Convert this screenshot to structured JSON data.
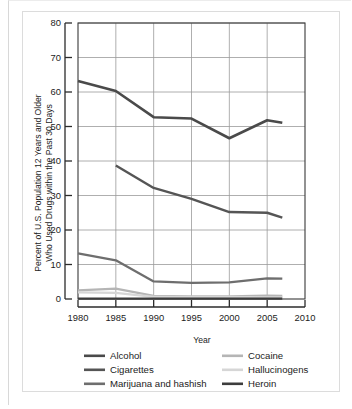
{
  "chart_data": {
    "type": "line",
    "title": "",
    "xlabel": "Year",
    "ylabel": "Percent of U.S. Population 12 Years and Older Who Used Drugs within the Past 30 Days",
    "ylabel_line1": "Percent of U.S. Population 12 Years and Older",
    "ylabel_line2": "Who Used Drugs within the Past 30 Days",
    "xlim": [
      1980,
      2010
    ],
    "ylim": [
      0,
      80
    ],
    "xticks": [
      1980,
      1985,
      1990,
      1995,
      2000,
      2005,
      2010
    ],
    "yticks": [
      0,
      10,
      20,
      30,
      40,
      50,
      60,
      70,
      80
    ],
    "xtick_labels": [
      "1980",
      "1985",
      "1990",
      "1995",
      "2000",
      "2005",
      "2010"
    ],
    "ytick_labels": [
      "0",
      "10",
      "20",
      "30",
      "40",
      "50",
      "60",
      "70",
      "80"
    ],
    "grid": true,
    "legend_position": "below",
    "series": [
      {
        "name": "Alcohol",
        "color": "#4a4a4a",
        "width": 2.6,
        "x": [
          1980,
          1985,
          1990,
          1995,
          2000,
          2005,
          2007
        ],
        "values": [
          63.2,
          60.3,
          52.7,
          52.3,
          46.6,
          51.8,
          51.1
        ]
      },
      {
        "name": "Cigarettes",
        "color": "#555555",
        "width": 2.4,
        "x": [
          1985,
          1990,
          1995,
          2000,
          2005,
          2007
        ],
        "values": [
          38.7,
          32.2,
          29.0,
          25.2,
          25.0,
          23.6
        ]
      },
      {
        "name": "Marijuana and hashish",
        "color": "#6e6e6e",
        "width": 2.3,
        "x": [
          1980,
          1985,
          1990,
          1995,
          2000,
          2005,
          2007
        ],
        "values": [
          13.2,
          11.2,
          5.1,
          4.7,
          4.8,
          6.0,
          5.9
        ]
      },
      {
        "name": "Cocaine",
        "color": "#b5b5b5",
        "width": 2.2,
        "x": [
          1980,
          1985,
          1990,
          1995,
          2000,
          2005,
          2007
        ],
        "values": [
          2.5,
          3.0,
          0.9,
          0.8,
          0.8,
          1.0,
          0.9
        ]
      },
      {
        "name": "Hallucinogens",
        "color": "#d6d6d6",
        "width": 2.2,
        "x": [
          1980,
          1985,
          1990,
          1995,
          2000,
          2005,
          2007
        ],
        "values": [
          1.9,
          1.8,
          0.6,
          0.6,
          0.6,
          0.5,
          0.5
        ]
      },
      {
        "name": "Heroin",
        "color": "#3d3d3d",
        "width": 2.2,
        "x": [
          1980,
          1985,
          1990,
          1995,
          2000,
          2005,
          2007
        ],
        "values": [
          0.1,
          0.1,
          0.1,
          0.1,
          0.1,
          0.1,
          0.1
        ]
      }
    ]
  },
  "legend": {
    "entries": [
      {
        "label": "Alcohol",
        "color": "#4a4a4a"
      },
      {
        "label": "Cigarettes",
        "color": "#555555"
      },
      {
        "label": "Marijuana and hashish",
        "color": "#6e6e6e"
      },
      {
        "label": "Cocaine",
        "color": "#b5b5b5"
      },
      {
        "label": "Hallucinogens",
        "color": "#d6d6d6"
      },
      {
        "label": "Heroin",
        "color": "#3d3d3d"
      }
    ]
  },
  "colors": {
    "axis": "#2b2b2b",
    "grid": "#9a9a9a",
    "panel_border": "#dcdcdc",
    "text": "#1c1c1c",
    "background": "#ffffff"
  }
}
